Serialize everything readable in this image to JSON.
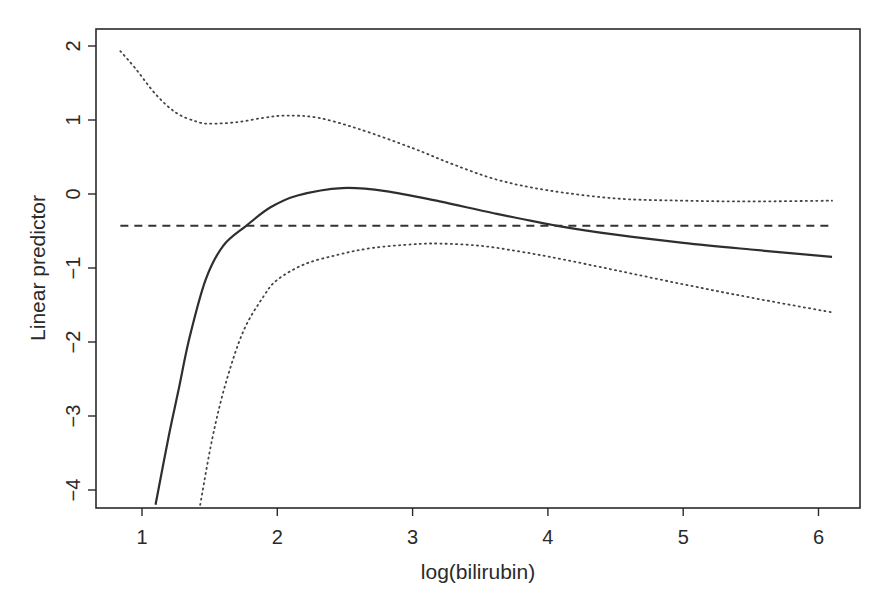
{
  "chart_data": {
    "type": "line",
    "title": "",
    "xlabel": "log(bilirubin)",
    "ylabel": "Linear predictor",
    "xlim": [
      0.64,
      6.32
    ],
    "ylim": [
      -4.2,
      2.2
    ],
    "x_ticks": [
      1,
      2,
      3,
      4,
      5,
      6
    ],
    "y_ticks": [
      -4,
      -3,
      -2,
      -1,
      0,
      1,
      2
    ],
    "x_tick_labels": [
      "1",
      "2",
      "3",
      "4",
      "5",
      "6"
    ],
    "y_tick_labels": [
      "−4",
      "−3",
      "−2",
      "−1",
      "0",
      "1",
      "2"
    ],
    "grid": false,
    "legend": null,
    "series": [
      {
        "name": "Estimated effect",
        "style": "solid",
        "x": [
          1.1,
          1.2,
          1.27,
          1.35,
          1.47,
          1.6,
          1.77,
          1.95,
          2.15,
          2.48,
          2.8,
          3.2,
          3.6,
          4.07,
          4.5,
          5.0,
          5.5,
          6.1
        ],
        "y": [
          -4.2,
          -3.25,
          -2.65,
          -1.95,
          -1.16,
          -0.7,
          -0.43,
          -0.18,
          -0.02,
          0.08,
          0.04,
          -0.1,
          -0.26,
          -0.43,
          -0.55,
          -0.66,
          -0.75,
          -0.85
        ]
      },
      {
        "name": "Upper confidence limit",
        "style": "dotted",
        "x": [
          0.84,
          0.95,
          1.1,
          1.25,
          1.4,
          1.5,
          1.7,
          1.9,
          2.07,
          2.3,
          2.6,
          3.0,
          3.3,
          3.63,
          4.0,
          4.5,
          5.0,
          5.5,
          6.1
        ],
        "y": [
          1.93,
          1.7,
          1.35,
          1.1,
          0.98,
          0.95,
          0.97,
          1.03,
          1.06,
          1.03,
          0.88,
          0.62,
          0.4,
          0.19,
          0.05,
          -0.06,
          -0.09,
          -0.1,
          -0.09
        ]
      },
      {
        "name": "Lower confidence limit",
        "style": "dotted",
        "x": [
          1.43,
          1.52,
          1.62,
          1.75,
          1.9,
          2.0,
          2.2,
          2.45,
          2.7,
          3.0,
          3.2,
          3.5,
          3.8,
          4.1,
          4.5,
          5.0,
          5.5,
          6.1
        ],
        "y": [
          -4.2,
          -3.3,
          -2.55,
          -1.85,
          -1.38,
          -1.16,
          -0.95,
          -0.82,
          -0.73,
          -0.68,
          -0.67,
          -0.7,
          -0.78,
          -0.88,
          -1.03,
          -1.22,
          -1.4,
          -1.6
        ]
      },
      {
        "name": "Reference level",
        "style": "dashed",
        "x": [
          0.84,
          6.1
        ],
        "y": [
          -0.43,
          -0.43
        ]
      }
    ]
  },
  "layout": {
    "plot_left": 96,
    "plot_right": 860,
    "plot_top": 29,
    "plot_bottom": 508,
    "x0_value": 1,
    "x0_px": 142,
    "px_per_x": 135.3,
    "y0_px": 194,
    "px_per_y": 74
  }
}
